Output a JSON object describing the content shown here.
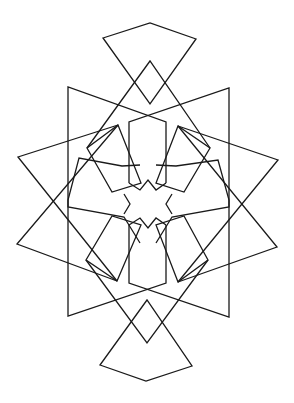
{
  "figure": {
    "stroke_color": "#1a1a1a",
    "background_color": "#ffffff",
    "center": [
      148,
      204
    ]
  }
}
